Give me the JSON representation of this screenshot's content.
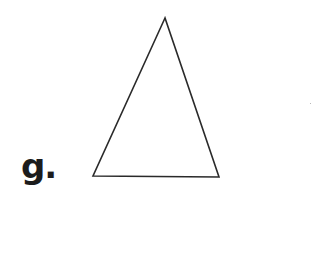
{
  "figure": {
    "label": "g.",
    "shape": "triangle",
    "vertices": {
      "apex": [
        165,
        18
      ],
      "bottom_left": [
        93,
        176
      ],
      "bottom_right": [
        219,
        177
      ]
    },
    "stroke_color": "#2a2a2a",
    "fill_color": "#ffffff"
  }
}
